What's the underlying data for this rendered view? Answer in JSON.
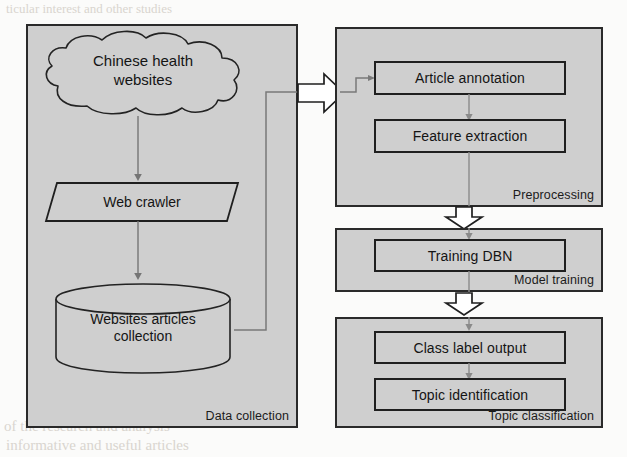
{
  "diagram": {
    "colors": {
      "panel_fill": "#cfcfcf",
      "box_fill": "#cfcfcf",
      "stroke": "#1f1f1f",
      "connector": "#6e6e6e",
      "page": "#fbfbfa",
      "arrow_fill": "#ffffff"
    },
    "panels": [
      {
        "id": "data-collection",
        "label": "Data collection"
      },
      {
        "id": "preprocessing",
        "label": "Preprocessing"
      },
      {
        "id": "model-training",
        "label": "Model training"
      },
      {
        "id": "topic-classification",
        "label": "Topic classification"
      }
    ],
    "nodes": {
      "cloud": {
        "label_line1": "Chinese health",
        "label_line2": "websites",
        "shape": "cloud"
      },
      "web_crawler": {
        "label": "Web crawler",
        "shape": "parallelogram"
      },
      "articles_db": {
        "label_line1": "Websites articles",
        "label_line2": "collection",
        "shape": "cylinder"
      },
      "article_annotation": {
        "label": "Article annotation",
        "shape": "rectangle"
      },
      "feature_extraction": {
        "label": "Feature extraction",
        "shape": "rectangle"
      },
      "training_dbn": {
        "label": "Training DBN",
        "shape": "rectangle"
      },
      "class_label_output": {
        "label": "Class label output",
        "shape": "rectangle"
      },
      "topic_identification": {
        "label": "Topic identification",
        "shape": "rectangle"
      }
    },
    "edges": [
      {
        "from": "cloud",
        "to": "web_crawler",
        "style": "thin-arrow"
      },
      {
        "from": "web_crawler",
        "to": "articles_db",
        "style": "thin-arrow"
      },
      {
        "from": "articles_db",
        "to": "preprocessing",
        "style": "thin-routed"
      },
      {
        "from": "data-collection",
        "to": "preprocessing",
        "style": "block-arrow-right"
      },
      {
        "from": "article_annotation",
        "to": "feature_extraction",
        "style": "thin-arrow"
      },
      {
        "from": "feature_extraction",
        "to": "training_dbn",
        "style": "thin-arrow"
      },
      {
        "from": "preprocessing",
        "to": "model-training",
        "style": "block-arrow-down"
      },
      {
        "from": "model-training",
        "to": "topic-classification",
        "style": "block-arrow-down"
      },
      {
        "from": "class_label_output",
        "to": "topic_identification",
        "style": "thin-arrow"
      }
    ]
  },
  "background_text": {
    "lines": [
      "ticular interest and other studies",
      "of the research and analysis",
      "informative and useful articles"
    ]
  }
}
